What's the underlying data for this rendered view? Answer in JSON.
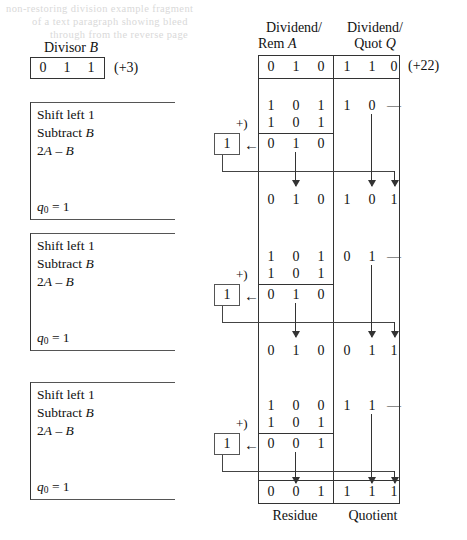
{
  "ghost_text": {
    "line1": "non-restoring division example fragment",
    "line2": "of a text paragraph showing bleed",
    "line3": "through from the reverse page"
  },
  "divisor": {
    "label": "Divisor B",
    "label_plain": "Divisor",
    "label_var": "B",
    "bits": [
      "0",
      "1",
      "1"
    ],
    "decimal": "(+3)"
  },
  "table": {
    "header_a_line1": "Dividend/",
    "header_a_line2": "Rem A",
    "header_a_line2_plain": "Rem",
    "header_a_var": "A",
    "header_q_line1": "Dividend/",
    "header_q_line2": "Quot Q",
    "header_q_line2_plain": "Quot",
    "header_q_var": "Q",
    "dividend_decimal": "(+22)",
    "initial_a": [
      "0",
      "1",
      "0"
    ],
    "initial_q": [
      "1",
      "1",
      "0"
    ],
    "footer_a": "Residue",
    "footer_q": "Quotient",
    "plus_marker": "+)",
    "dash": "—",
    "left_arrow": "←"
  },
  "steps": [
    {
      "id": "step-1",
      "line0": "Shift left 1",
      "line1_plain": "Subtract",
      "line1_var": "B",
      "line2": "2A – B",
      "line2_pre": "2",
      "line2_var_a": "A",
      "line2_op": " – ",
      "line2_var_b": "B",
      "q_label_q": "q",
      "q_label_sub": "0",
      "q_label_eq": " = 1",
      "shifted_a": [
        "1",
        "0",
        "1"
      ],
      "shifted_q": [
        "1",
        "0",
        "—"
      ],
      "addend": [
        "1",
        "0",
        "1"
      ],
      "result_a": [
        "0",
        "1",
        "0"
      ],
      "carry": "1",
      "next_a": [
        "0",
        "1",
        "0"
      ],
      "next_q": [
        "1",
        "0",
        "1"
      ]
    },
    {
      "id": "step-2",
      "line0": "Shift left 1",
      "line1_plain": "Subtract",
      "line1_var": "B",
      "line2": "2A – B",
      "line2_pre": "2",
      "line2_var_a": "A",
      "line2_op": " – ",
      "line2_var_b": "B",
      "q_label_q": "q",
      "q_label_sub": "0",
      "q_label_eq": " = 1",
      "shifted_a": [
        "1",
        "0",
        "1"
      ],
      "shifted_q": [
        "0",
        "1",
        "—"
      ],
      "addend": [
        "1",
        "0",
        "1"
      ],
      "result_a": [
        "0",
        "1",
        "0"
      ],
      "carry": "1",
      "next_a": [
        "0",
        "1",
        "0"
      ],
      "next_q": [
        "0",
        "1",
        "1"
      ]
    },
    {
      "id": "step-3",
      "line0": "Shift left 1",
      "line1_plain": "Subtract",
      "line1_var": "B",
      "line2": "2A – B",
      "line2_pre": "2",
      "line2_var_a": "A",
      "line2_op": " – ",
      "line2_var_b": "B",
      "q_label_q": "q",
      "q_label_sub": "0",
      "q_label_eq": " = 1",
      "shifted_a": [
        "1",
        "0",
        "0"
      ],
      "shifted_q": [
        "1",
        "1",
        "—"
      ],
      "addend": [
        "1",
        "0",
        "1"
      ],
      "result_a": [
        "0",
        "0",
        "1"
      ],
      "carry": "1",
      "next_a": [
        "0",
        "0",
        "1"
      ],
      "next_q": [
        "1",
        "1",
        "1"
      ]
    }
  ]
}
